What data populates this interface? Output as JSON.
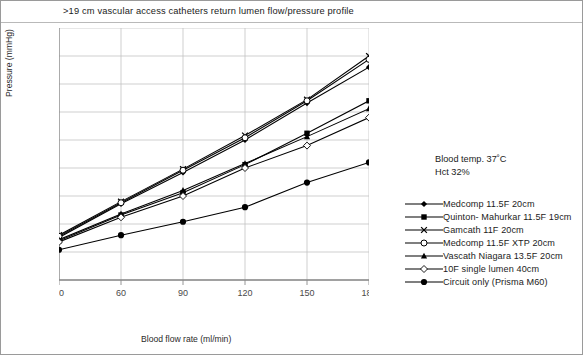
{
  "figure": {
    "title": ">19 cm vascular access catheters return lumen flow/pressure profile",
    "conditions": {
      "blood_temp": "Blood temp. 37˚C",
      "hct": "Hct 32%"
    }
  },
  "chart_data": {
    "type": "line",
    "title": ">19 cm vascular access catheters return lumen flow/pressure profile",
    "xlabel": "Blood flow rate (ml/min)",
    "ylabel": "Pressure (mmHg)",
    "x": [
      30,
      60,
      90,
      120,
      150,
      180
    ],
    "xticks": [
      "30",
      "60",
      "90",
      "120",
      "150",
      "180"
    ],
    "yticks": [
      "0",
      "25",
      "50",
      "75",
      "100",
      "125",
      "150",
      "175",
      "200",
      "225"
    ],
    "xlim": [
      30,
      180
    ],
    "ylim": [
      0,
      225
    ],
    "grid": true,
    "legend_position": "right",
    "series": [
      {
        "name": "Medcomp 11.5F 20cm",
        "marker": "filled-diamond",
        "values": [
          38,
          68,
          96,
          125,
          158,
          190
        ]
      },
      {
        "name": "Quinton- Mahurkar 11.5F 19cm",
        "marker": "filled-square",
        "values": [
          35,
          58,
          78,
          103,
          131,
          160
        ]
      },
      {
        "name": "Gamcath 11F 20cm",
        "marker": "cross",
        "values": [
          40,
          70,
          99,
          129,
          161,
          200
        ]
      },
      {
        "name": "Medcomp 11.5F XTP 20cm",
        "marker": "open-circle",
        "values": [
          39,
          69,
          98,
          127,
          160,
          197
        ]
      },
      {
        "name": "Vascath Niagara 13.5F 20cm",
        "marker": "filled-triangle",
        "values": [
          36,
          59,
          80,
          104,
          128,
          153
        ]
      },
      {
        "name": "10F single lumen 40cm",
        "marker": "open-diamond",
        "values": [
          34,
          56,
          75,
          100,
          120,
          145
        ]
      },
      {
        "name": "Circuit only (Prisma M60)",
        "marker": "filled-circle",
        "values": [
          27,
          40,
          52,
          65,
          87,
          105
        ]
      }
    ]
  },
  "legend": {
    "items": [
      {
        "label": "Medcomp 11.5F 20cm"
      },
      {
        "label": "Quinton- Mahurkar 11.5F 19cm"
      },
      {
        "label": "Gamcath 11F 20cm"
      },
      {
        "label": "Medcomp 11.5F XTP 20cm"
      },
      {
        "label": "Vascath Niagara 13.5F 20cm"
      },
      {
        "label": "10F single lumen 40cm"
      },
      {
        "label": "Circuit only (Prisma M60)"
      }
    ]
  }
}
